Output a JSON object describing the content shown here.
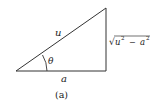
{
  "figure": {
    "caption": "(a)",
    "hypotenuse_label": "u",
    "angle_label": "θ",
    "base_label": "a",
    "opposite_label": {
      "radical": "√",
      "u": "u",
      "u_exp": "2",
      "minus": "−",
      "a": "a",
      "a_exp": "2"
    },
    "line_color": "#333333"
  }
}
